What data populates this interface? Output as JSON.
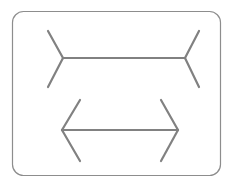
{
  "canvas": {
    "width": 233,
    "height": 188,
    "background_color": "#ffffff",
    "title": "Muller-Lyer illusion figure"
  },
  "frame": {
    "name": "rounded-rectangle-border",
    "x": 12.5,
    "y": 11.5,
    "width": 208,
    "height": 164,
    "corner_radius": 11,
    "stroke_color": "#8d8d8d",
    "stroke_width": 1.2,
    "fill_color": "#ffffff"
  },
  "style": {
    "line_color": "#818181",
    "line_width": 2.2,
    "line_cap": "round"
  },
  "figures": [
    {
      "id": "top-figure",
      "name": "muller-lyer-outward-fins",
      "description": "Horizontal shaft with fins splaying outward (appears shorter)",
      "shaft": {
        "x1": 63,
        "y1": 58,
        "x2": 185,
        "y2": 58
      },
      "fins": [
        {
          "name": "top-left-upper-fin",
          "x1": 63,
          "y1": 58,
          "x2": 48,
          "y2": 31
        },
        {
          "name": "top-left-lower-fin",
          "x1": 63,
          "y1": 58,
          "x2": 48,
          "y2": 87
        },
        {
          "name": "top-right-upper-fin",
          "x1": 185,
          "y1": 58,
          "x2": 199,
          "y2": 31
        },
        {
          "name": "top-right-lower-fin",
          "x1": 185,
          "y1": 58,
          "x2": 199,
          "y2": 87
        }
      ]
    },
    {
      "id": "bottom-figure",
      "name": "muller-lyer-inward-arrowheads",
      "description": "Horizontal shaft with arrowheads pointing outward (appears longer)",
      "shaft": {
        "x1": 62,
        "y1": 130,
        "x2": 178,
        "y2": 130
      },
      "fins": [
        {
          "name": "bottom-left-upper-fin",
          "x1": 62,
          "y1": 130,
          "x2": 80,
          "y2": 100
        },
        {
          "name": "bottom-left-lower-fin",
          "x1": 62,
          "y1": 130,
          "x2": 80,
          "y2": 161
        },
        {
          "name": "bottom-right-upper-fin",
          "x1": 178,
          "y1": 130,
          "x2": 161,
          "y2": 100
        },
        {
          "name": "bottom-right-lower-fin",
          "x1": 178,
          "y1": 130,
          "x2": 161,
          "y2": 161
        }
      ]
    }
  ],
  "chart_data": {
    "type": "diagram",
    "shaft_lengths_px": [
      122,
      116
    ],
    "labels": [
      "outward fins (top)",
      "inward arrowheads (bottom)"
    ]
  }
}
